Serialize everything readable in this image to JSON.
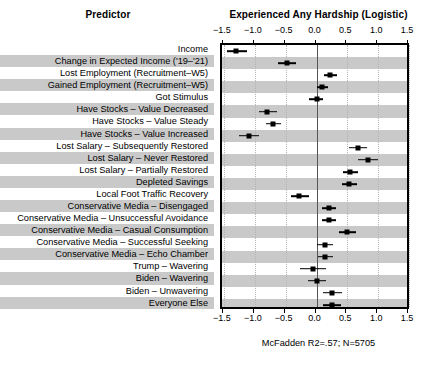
{
  "header": {
    "predictor_title": "Predictor",
    "outcome_title": "Experienced Any Hardship (Logistic)"
  },
  "footnote": "McFadden R2=.57; N=5705",
  "chart_data": {
    "type": "scatter",
    "subtype": "forest-plot",
    "title": "Experienced Any Hardship (Logistic)",
    "xlabel": "",
    "ylabel": "Predictor",
    "xlim": [
      -1.5,
      1.5
    ],
    "xticks": [
      -1.5,
      -1.0,
      -0.5,
      0.0,
      0.5,
      1.0,
      1.5
    ],
    "xtick_labels": [
      "−1.5",
      "−1.0",
      "−0.5",
      "0.0",
      "0.5",
      "1.0",
      "1.5"
    ],
    "grid": "vertical-dotted",
    "reference_line": 0.0,
    "legend": "none",
    "annotation": "McFadden R2=.57; N=5705",
    "categories": [
      "Income",
      "Change in Expected Income ('19–'21)",
      "Lost Employment (Recruitment–W5)",
      "Gained Employment (Recruitment–W5)",
      "Got Stimulus",
      "Have Stocks – Value Decreased",
      "Have Stocks – Value Steady",
      "Have Stocks – Value Increased",
      "Lost Salary – Subsequently Restored",
      "Lost Salary – Never Restored",
      "Lost Salary – Partially Restored",
      "Depleted Savings",
      "Local Foot Traffic Recovery",
      "Conservative Media – Disengaged",
      "Conservative Media – Unsuccessful Avoidance",
      "Conservative Media – Casual Consumption",
      "Conservative Media – Successful Seeking",
      "Conservative Media – Echo Chamber",
      "Trump – Wavering",
      "Biden – Wavering",
      "Biden – Unwavering",
      "Everyone Else"
    ],
    "estimates": [
      -1.31,
      -0.48,
      0.22,
      0.09,
      0.0,
      -0.8,
      -0.7,
      -1.1,
      0.67,
      0.83,
      0.55,
      0.53,
      -0.28,
      0.2,
      0.2,
      0.5,
      0.13,
      0.13,
      -0.05,
      0.0,
      0.25,
      0.25
    ],
    "ci_low": [
      -1.45,
      -0.62,
      0.12,
      0.01,
      -0.12,
      -0.94,
      -0.82,
      -1.26,
      0.52,
      0.67,
      0.43,
      0.41,
      -0.42,
      0.09,
      0.09,
      0.36,
      0.01,
      0.03,
      -0.26,
      -0.14,
      0.1,
      0.11
    ],
    "ci_high": [
      -1.13,
      -0.34,
      0.34,
      0.18,
      0.1,
      -0.64,
      -0.57,
      -0.93,
      0.82,
      0.99,
      0.68,
      0.66,
      -0.12,
      0.32,
      0.32,
      0.64,
      0.26,
      0.26,
      0.15,
      0.16,
      0.42,
      0.39
    ]
  }
}
